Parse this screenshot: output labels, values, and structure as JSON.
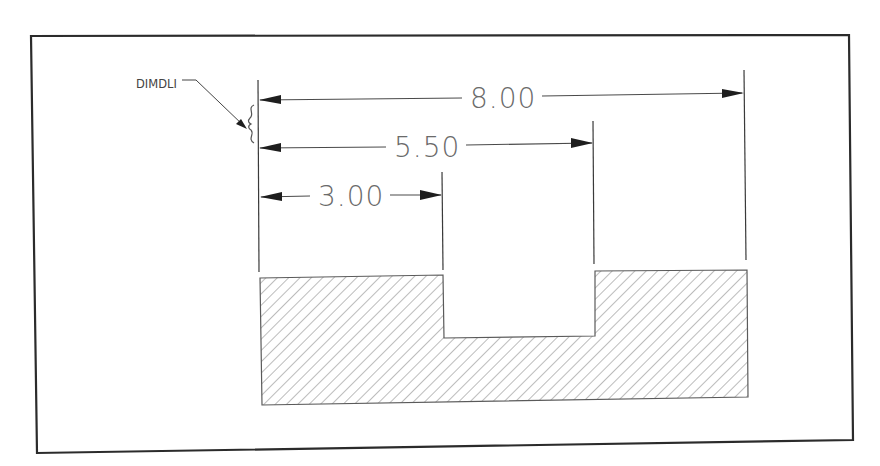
{
  "figure": {
    "callout_label": "DIMDLI",
    "dimensions": [
      {
        "id": "overall",
        "value": "8.00"
      },
      {
        "id": "middle",
        "value": "5.50"
      },
      {
        "id": "short",
        "value": "3.00"
      }
    ],
    "hatch_pattern": "diagonal-45",
    "colors": {
      "line": "#2b2b2b",
      "dimension_text": "#6a6a6a",
      "hatch": "#7a7a7a",
      "background": "#ffffff"
    }
  }
}
